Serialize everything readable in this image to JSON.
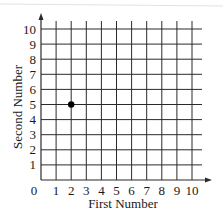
{
  "chart_data": {
    "type": "scatter",
    "title": "",
    "xlabel": "First Number",
    "ylabel": "Second Number",
    "xlim": [
      0,
      10
    ],
    "ylim": [
      0,
      10
    ],
    "x_ticks": [
      "0",
      "1",
      "2",
      "3",
      "4",
      "5",
      "6",
      "7",
      "8",
      "9",
      "10"
    ],
    "y_ticks": [
      "1",
      "2",
      "3",
      "4",
      "5",
      "6",
      "7",
      "8",
      "9",
      "10"
    ],
    "grid": true,
    "legend": null,
    "series": [
      {
        "name": "point",
        "points": [
          {
            "x": 2,
            "y": 5
          }
        ]
      }
    ]
  },
  "colors": {
    "grid": "#2a2a2a",
    "point": "#000000",
    "background": "#ffffff"
  }
}
